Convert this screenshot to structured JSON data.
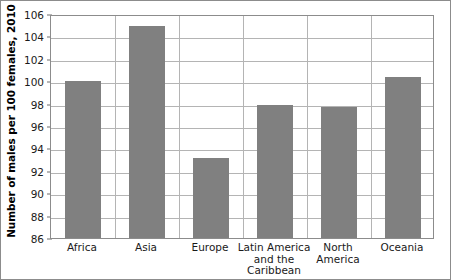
{
  "chart_data": {
    "type": "bar",
    "title": "",
    "xlabel": "",
    "ylabel": "Number of males per 100 females, 2010",
    "categories": [
      "Africa",
      "Asia",
      "Europe",
      "Latin America and the Caribbean",
      "North America",
      "Oceania"
    ],
    "category_lines": [
      [
        "Africa"
      ],
      [
        "Asia"
      ],
      [
        "Europe"
      ],
      [
        "Latin America",
        "and the",
        "Caribbean"
      ],
      [
        "North",
        "America"
      ],
      [
        "Oceania"
      ]
    ],
    "values": [
      100.0,
      104.9,
      93.1,
      97.9,
      97.7,
      100.4
    ],
    "ylim": [
      86,
      106
    ],
    "ytick_labels": [
      "106",
      "104",
      "102",
      "100",
      "98",
      "96",
      "94",
      "92",
      "90",
      "88",
      "86"
    ],
    "yticks": [
      106,
      104,
      102,
      100,
      98,
      96,
      94,
      92,
      90,
      88,
      86
    ],
    "grid": true,
    "legend": false,
    "bar_color": "#808080",
    "gridline_color": "#b4b4b4",
    "axis_color": "#8c8c8c",
    "background_color": "#ffffff"
  }
}
